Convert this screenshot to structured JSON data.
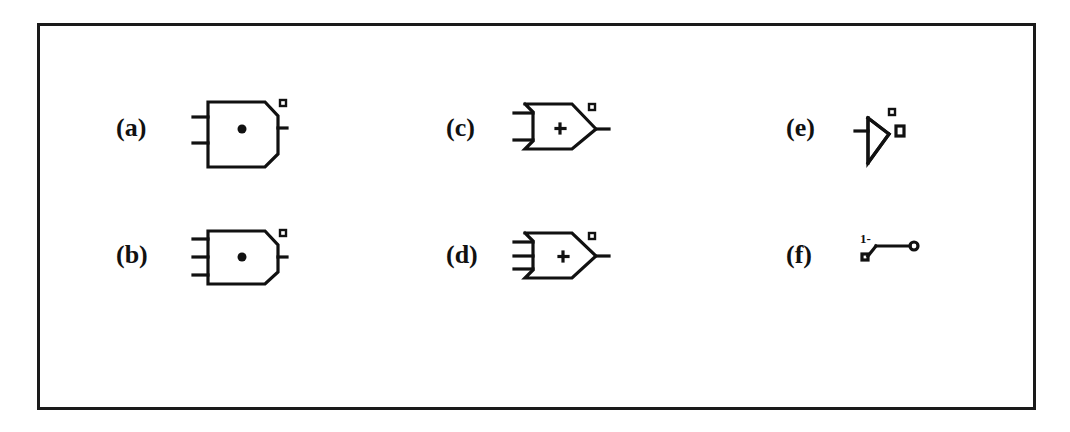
{
  "figure": {
    "items": [
      {
        "id": "a",
        "label": "(a)",
        "symbol": "and-gate-2-input-inverted-bubble"
      },
      {
        "id": "b",
        "label": "(b)",
        "symbol": "and-gate-3-input-inverted-bubble"
      },
      {
        "id": "c",
        "label": "(c)",
        "symbol": "or-gate-2-input-inverted-bubble"
      },
      {
        "id": "d",
        "label": "(d)",
        "symbol": "or-gate-3-input-inverted-bubble"
      },
      {
        "id": "e",
        "label": "(e)",
        "symbol": "inverter-buffer"
      },
      {
        "id": "f",
        "label": "(f)",
        "symbol": "switch"
      }
    ],
    "and_symbol_glyph": "•",
    "or_symbol_glyph": "+",
    "switch_annotation": "1-"
  },
  "colors": {
    "ink": "#111111",
    "background": "#ffffff",
    "frame": "#1a1a1a"
  }
}
